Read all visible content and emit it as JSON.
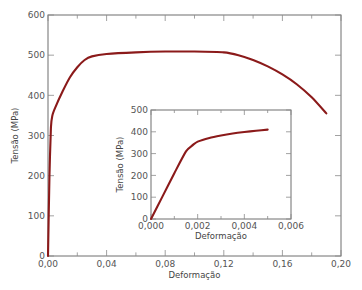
{
  "chart_data": [
    {
      "id": "main",
      "type": "line",
      "title": "",
      "xlabel": "Deformação",
      "ylabel": "Tensão (MPa)",
      "xlim": [
        0,
        0.2
      ],
      "ylim": [
        0,
        600
      ],
      "grid": false,
      "legend": null,
      "x_ticks": [
        "0,00",
        "0,04",
        "0,08",
        "0,12",
        "0,16",
        "0,20"
      ],
      "x_tick_values": [
        0,
        0.04,
        0.08,
        0.12,
        0.16,
        0.2
      ],
      "x_minor_tick_values": [
        0.02,
        0.06,
        0.1,
        0.14,
        0.18
      ],
      "y_ticks": [
        "0",
        "100",
        "200",
        "300",
        "400",
        "500",
        "600"
      ],
      "y_tick_values": [
        0,
        100,
        200,
        300,
        400,
        500,
        600
      ],
      "color": "#8b1a1a",
      "series": [
        {
          "name": "stress-strain",
          "x": [
            0.0,
            0.001,
            0.002,
            0.003,
            0.005,
            0.01,
            0.015,
            0.02,
            0.025,
            0.03,
            0.04,
            0.06,
            0.08,
            0.1,
            0.12,
            0.13,
            0.14,
            0.15,
            0.16,
            0.17,
            0.18,
            0.19
          ],
          "y": [
            0,
            200,
            320,
            350,
            370,
            410,
            445,
            470,
            488,
            497,
            503,
            507,
            509,
            509,
            507,
            500,
            488,
            472,
            452,
            427,
            395,
            355
          ]
        }
      ]
    },
    {
      "id": "inset",
      "type": "line",
      "title": "",
      "xlabel": "Deformação",
      "ylabel": "Tensão (MPa)",
      "xlim": [
        0,
        0.006
      ],
      "ylim": [
        0,
        500
      ],
      "grid": false,
      "legend": null,
      "x_ticks": [
        "0,000",
        "0,002",
        "0,004",
        "0,006"
      ],
      "x_tick_values": [
        0,
        0.002,
        0.004,
        0.006
      ],
      "x_minor_tick_values": [
        0.001,
        0.003,
        0.005
      ],
      "y_ticks": [
        "0",
        "100",
        "200",
        "300",
        "400",
        "500"
      ],
      "y_tick_values": [
        0,
        100,
        200,
        300,
        400,
        500
      ],
      "color": "#8b1a1a",
      "series": [
        {
          "name": "stress-strain (elastic region)",
          "x": [
            0.0,
            0.0005,
            0.001,
            0.0015,
            0.0018,
            0.002,
            0.0025,
            0.003,
            0.0035,
            0.004,
            0.0045,
            0.005
          ],
          "y": [
            0,
            105,
            210,
            310,
            340,
            355,
            372,
            383,
            392,
            399,
            405,
            410
          ]
        }
      ]
    }
  ]
}
